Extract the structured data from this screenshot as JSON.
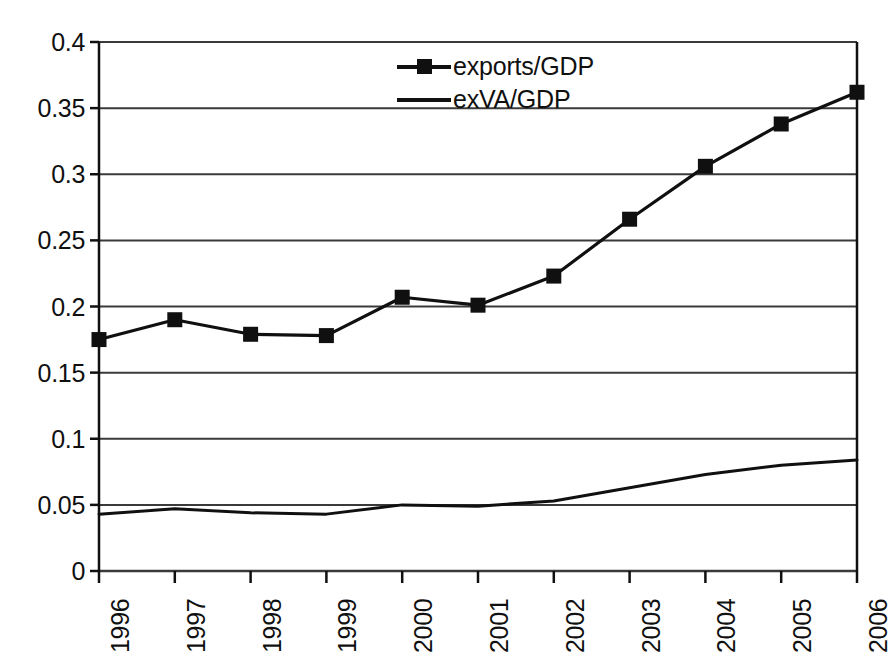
{
  "chart_data": {
    "type": "line",
    "title": "",
    "xlabel": "",
    "ylabel": "",
    "categories": [
      "1996",
      "1997",
      "1998",
      "1999",
      "2000",
      "2001",
      "2002",
      "2003",
      "2004",
      "2005",
      "2006"
    ],
    "x": [
      1996,
      1997,
      1998,
      1999,
      2000,
      2001,
      2002,
      2003,
      2004,
      2005,
      2006
    ],
    "series": [
      {
        "name": "exports/GDP",
        "marker": "filled-square",
        "color": "#101010",
        "values": [
          0.175,
          0.19,
          0.179,
          0.178,
          0.207,
          0.201,
          0.223,
          0.266,
          0.306,
          0.338,
          0.362
        ]
      },
      {
        "name": "exVA/GDP",
        "marker": "none",
        "color": "#101010",
        "values": [
          0.043,
          0.047,
          0.044,
          0.043,
          0.05,
          0.049,
          0.053,
          0.063,
          0.073,
          0.08,
          0.084
        ]
      }
    ],
    "ylim": [
      0,
      0.4
    ],
    "ytick_step": 0.05,
    "yticks": [
      "0.4",
      "0.35",
      "0.3",
      "0.25",
      "0.2",
      "0.15",
      "0.1",
      "0.05",
      "0"
    ],
    "ytick_values": [
      0.4,
      0.35,
      0.3,
      0.25,
      0.2,
      0.15,
      0.1,
      0.05,
      0
    ],
    "grid": "horizontal",
    "legend_position": "inside-top-center",
    "xtick_rotation": -90
  },
  "legend": {
    "items": [
      {
        "label": "exports/GDP",
        "key": "line-with-square-marker"
      },
      {
        "label": "exVA/GDP",
        "key": "plain-line"
      }
    ]
  },
  "colors": {
    "series": "#101010",
    "grid": "#3a3a3a",
    "axis": "#101010",
    "background": "#ffffff"
  }
}
